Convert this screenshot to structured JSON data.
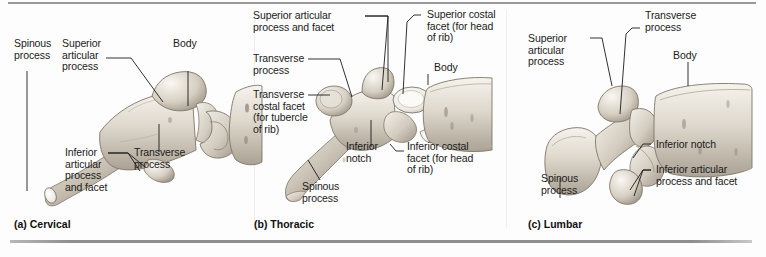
{
  "figure": {
    "background": "#fdfdfd",
    "ink": "#1b1b1b",
    "bone_light": "#f2efe9",
    "bone_mid": "#cfc9bd",
    "bone_dark": "#9d968a"
  },
  "panels": [
    {
      "id": "cervical",
      "caption": "(a) Cervical",
      "labels": [
        {
          "name": "spinous-process",
          "text": "Spinous\nprocess"
        },
        {
          "name": "superior-articular-process",
          "text": "Superior\narticular\nprocess"
        },
        {
          "name": "body",
          "text": "Body"
        },
        {
          "name": "inferior-articular-process-and-facet",
          "text": "Inferior\narticular\nprocess\nand facet"
        },
        {
          "name": "transverse-process",
          "text": "Transverse\nprocess"
        }
      ]
    },
    {
      "id": "thoracic",
      "caption": "(b) Thoracic",
      "labels": [
        {
          "name": "superior-articular-process-and-facet",
          "text": "Superior articular\nprocess and facet"
        },
        {
          "name": "transverse-process",
          "text": "Transverse\nprocess"
        },
        {
          "name": "transverse-costal-facet",
          "text": "Transverse\ncostal facet\n(for tubercle\nof rib)"
        },
        {
          "name": "superior-costal-facet",
          "text": "Superior costal\nfacet (for head\nof rib)"
        },
        {
          "name": "body",
          "text": "Body"
        },
        {
          "name": "inferior-notch",
          "text": "Inferior\nnotch"
        },
        {
          "name": "inferior-costal-facet",
          "text": "Inferior costal\nfacet (for head\nof rib)"
        },
        {
          "name": "spinous-process",
          "text": "Spinous\nprocess"
        }
      ]
    },
    {
      "id": "lumbar",
      "caption": "(c) Lumbar",
      "labels": [
        {
          "name": "superior-articular-process",
          "text": "Superior\narticular\nprocess"
        },
        {
          "name": "transverse-process",
          "text": "Transverse\nprocess"
        },
        {
          "name": "body",
          "text": "Body"
        },
        {
          "name": "inferior-notch",
          "text": "Inferior notch"
        },
        {
          "name": "inferior-articular-process-and-facet",
          "text": "Inferior articular\nprocess and facet"
        },
        {
          "name": "spinous-process",
          "text": "Spinous\nprocess"
        }
      ]
    }
  ]
}
